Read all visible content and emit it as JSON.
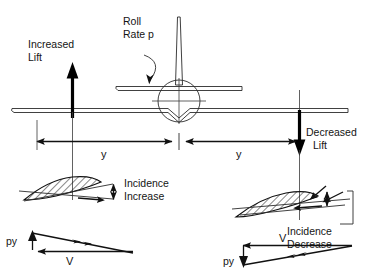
{
  "diagram": {
    "background_color": "#ffffff",
    "line_color": "#111111",
    "labels": {
      "increased_lift_line1": "Increased",
      "increased_lift_line2": "Lift",
      "roll_rate_line1": "Roll",
      "roll_rate_line2": "Rate p",
      "decreased_lift_line1": "Decreased",
      "decreased_lift_line2": "Lift",
      "span_left": "y",
      "span_right": "y",
      "incidence_increase_line1": "Incidence",
      "incidence_increase_line2": "Increase",
      "incidence_decrease_line1": "Incidence",
      "incidence_decrease_line2": "Decrease",
      "velocity_left_py": "py",
      "velocity_left_v": "V",
      "velocity_right_py": "py",
      "velocity_right_v": "V"
    },
    "elements": {
      "aircraft": "front-view-aircraft-silhouette",
      "left_wing_arrow": "thick-up-arrow-increased-lift",
      "right_wing_arrow": "thick-down-arrow-decreased-lift",
      "roll_arrow": "curved-arrow-roll-direction",
      "left_airfoil": "hatched-airfoil-section-left",
      "right_airfoil": "hatched-airfoil-section-right",
      "left_velocity_triangle": "velocity-vector-triangle-left",
      "right_velocity_triangle": "velocity-vector-triangle-right",
      "span_dimension_left": "dimension-arrow-y-left",
      "span_dimension_right": "dimension-arrow-y-right"
    }
  }
}
